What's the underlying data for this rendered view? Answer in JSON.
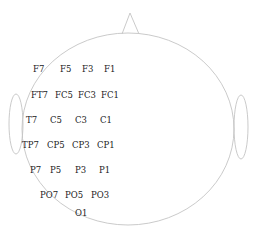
{
  "diagram": {
    "colors": {
      "outline": "#c4c4c4",
      "text": "#222222",
      "background": "#ffffff"
    },
    "head": {
      "cx": 128,
      "cy": 129,
      "rx": 106,
      "ry": 96
    },
    "nose": {
      "apex": [
        130,
        13
      ],
      "left": [
        122,
        34
      ],
      "right": [
        139,
        34
      ]
    },
    "ears": [
      {
        "side": "left",
        "cx": 16,
        "cy": 124,
        "rx": 7,
        "ry": 30
      },
      {
        "side": "right",
        "cx": 241,
        "cy": 127,
        "rx": 7,
        "ry": 32
      }
    ],
    "rows": [
      {
        "y": 72,
        "electrodes": [
          {
            "label": "F7",
            "x": 33
          },
          {
            "label": "F5",
            "x": 60
          },
          {
            "label": "F3",
            "x": 82
          },
          {
            "label": "F1",
            "x": 104
          }
        ]
      },
      {
        "y": 98,
        "electrodes": [
          {
            "label": "FT7",
            "x": 31
          },
          {
            "label": "FC5",
            "x": 55
          },
          {
            "label": "FC3",
            "x": 78
          },
          {
            "label": "FC1",
            "x": 101
          }
        ]
      },
      {
        "y": 123,
        "electrodes": [
          {
            "label": "T7",
            "x": 26
          },
          {
            "label": "C5",
            "x": 50
          },
          {
            "label": "C3",
            "x": 75
          },
          {
            "label": "C1",
            "x": 100
          }
        ]
      },
      {
        "y": 148,
        "electrodes": [
          {
            "label": "TP7",
            "x": 22
          },
          {
            "label": "CP5",
            "x": 47
          },
          {
            "label": "CP3",
            "x": 72
          },
          {
            "label": "CP1",
            "x": 97
          }
        ]
      },
      {
        "y": 173,
        "electrodes": [
          {
            "label": "P7",
            "x": 30
          },
          {
            "label": "P5",
            "x": 50
          },
          {
            "label": "P3",
            "x": 75
          },
          {
            "label": "P1",
            "x": 99
          }
        ]
      },
      {
        "y": 198,
        "electrodes": [
          {
            "label": "PO7",
            "x": 40
          },
          {
            "label": "PO5",
            "x": 65
          },
          {
            "label": "PO3",
            "x": 91
          }
        ]
      },
      {
        "y": 216,
        "electrodes": [
          {
            "label": "O1",
            "x": 75
          }
        ]
      }
    ]
  }
}
